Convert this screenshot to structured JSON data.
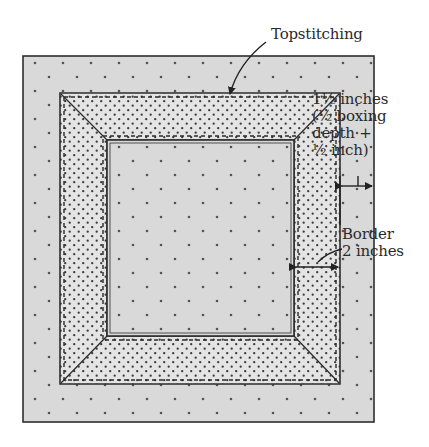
{
  "diagram": {
    "colors": {
      "fabric": "#d9d9d9",
      "fabric_dot": "#555555",
      "boxing": "#e4e4e4",
      "boxing_dot": "#3a3a3a",
      "outline": "#2e2e2e",
      "background": "#ffffff"
    },
    "outer_square": {
      "x": 23,
      "y": 56,
      "w": 351,
      "h": 366
    },
    "boxing_band_outer": {
      "x": 60,
      "y": 93,
      "w": 280,
      "h": 291
    },
    "inner_square": {
      "x": 107,
      "y": 140,
      "w": 187,
      "h": 196
    },
    "labels": {
      "topstitching": "Topstitching",
      "boxing_seam": {
        "line1": "1½ inches",
        "line2": "(½ boxing",
        "line3": "depth +",
        "line4": "½ inch)"
      },
      "border": {
        "line1": "Border",
        "line2": "2 inches"
      }
    },
    "dimensions": [
      {
        "name": "seam-allowance",
        "from_x": 340,
        "to_x": 374,
        "y": 186
      },
      {
        "name": "border-width",
        "from_x": 294,
        "to_x": 340,
        "y": 267
      }
    ]
  }
}
